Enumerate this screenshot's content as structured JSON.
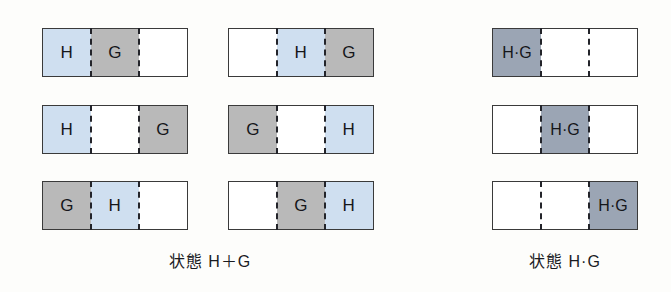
{
  "figure": {
    "background_color": "#fdfdfb",
    "colors": {
      "h_fill": "#cfdff0",
      "g_fill": "#b9b9b9",
      "hg_fill": "#9ba5b4",
      "empty_fill": "#ffffff",
      "border": "#3a3a3a",
      "divider": "#23242a",
      "text": "#15161a"
    }
  },
  "groups": [
    {
      "name": "state-h-plus-g",
      "caption": "状態 H＋G",
      "rows": [
        {
          "name": "row-1",
          "cells": [
            {
              "label": "H",
              "fill": "h"
            },
            {
              "label": "G",
              "fill": "g"
            },
            {
              "label": "",
              "fill": "empty"
            }
          ]
        },
        {
          "name": "row-2",
          "cells": [
            {
              "label": "H",
              "fill": "h"
            },
            {
              "label": "",
              "fill": "empty"
            },
            {
              "label": "G",
              "fill": "g"
            }
          ]
        },
        {
          "name": "row-3",
          "cells": [
            {
              "label": "G",
              "fill": "g"
            },
            {
              "label": "H",
              "fill": "h"
            },
            {
              "label": "",
              "fill": "empty"
            }
          ]
        }
      ]
    },
    {
      "name": "state-h-plus-g-second-column",
      "caption": "",
      "rows": [
        {
          "name": "row-1",
          "cells": [
            {
              "label": "",
              "fill": "empty"
            },
            {
              "label": "H",
              "fill": "h"
            },
            {
              "label": "G",
              "fill": "g"
            }
          ]
        },
        {
          "name": "row-2",
          "cells": [
            {
              "label": "G",
              "fill": "g"
            },
            {
              "label": "",
              "fill": "empty"
            },
            {
              "label": "H",
              "fill": "h"
            }
          ]
        },
        {
          "name": "row-3",
          "cells": [
            {
              "label": "",
              "fill": "empty"
            },
            {
              "label": "G",
              "fill": "g"
            },
            {
              "label": "H",
              "fill": "h"
            }
          ]
        }
      ]
    },
    {
      "name": "state-h-dot-g",
      "caption": "状態 H·G",
      "rows": [
        {
          "name": "row-1",
          "cells": [
            {
              "label": "H·G",
              "fill": "hg"
            },
            {
              "label": "",
              "fill": "empty"
            },
            {
              "label": "",
              "fill": "empty"
            }
          ]
        },
        {
          "name": "row-2",
          "cells": [
            {
              "label": "",
              "fill": "empty"
            },
            {
              "label": "H·G",
              "fill": "hg"
            },
            {
              "label": "",
              "fill": "empty"
            }
          ]
        },
        {
          "name": "row-3",
          "cells": [
            {
              "label": "",
              "fill": "empty"
            },
            {
              "label": "",
              "fill": "empty"
            },
            {
              "label": "H·G",
              "fill": "hg"
            }
          ]
        }
      ]
    }
  ]
}
